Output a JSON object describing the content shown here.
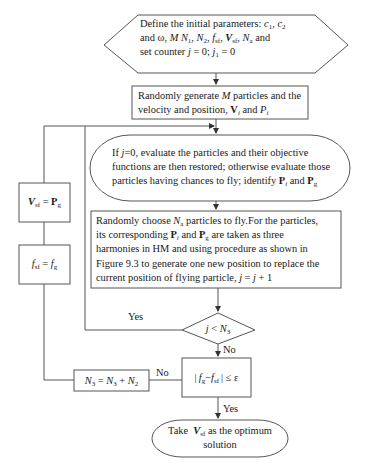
{
  "flowchart": {
    "start": {
      "shape": "hexagon",
      "lines": [
        "Define the initial parameters: c1, c2",
        "and ω, M N1, N2, fsf, Vsf, Na and",
        "set counter j = 0; j1 = 0"
      ]
    },
    "generate": {
      "shape": "rectangle",
      "lines": [
        "Randomly generate M particles and the",
        "velocity and position, Vi and Pi"
      ]
    },
    "evaluate": {
      "shape": "rounded",
      "lines": [
        "If j=0, evaluate the particles and their objective",
        "functions are then restored; otherwise evaluate those",
        "particles having chances to fly; identify Pi and Pg"
      ]
    },
    "fly": {
      "shape": "rectangle",
      "lines": [
        "Randomly choose Na particles to fly.For the particles,",
        "its corresponding Pi and Pg are taken as three",
        "harmonies in HM and using procedure as shown in",
        "Figure 9.3 to generate one new position to replace the",
        "current position of flying particle, j = j + 1"
      ]
    },
    "decision_loop": {
      "shape": "diamond",
      "text": "j < N3",
      "yes_label": "Yes",
      "no_label": "No"
    },
    "convergence_check": {
      "shape": "rectangle",
      "text": "|fg − fsf| ≤ ε",
      "yes_label": "Yes",
      "no_label": "No"
    },
    "update_n3": {
      "shape": "rectangle",
      "text": "N3 = N3 + N2"
    },
    "update_fsf": {
      "shape": "rectangle",
      "text": "fsf = fg"
    },
    "update_vsf": {
      "shape": "rectangle",
      "text": "Vsf = Pg"
    },
    "end": {
      "shape": "terminator",
      "lines": [
        "Take  Vsf as the optimum",
        "solution"
      ]
    }
  },
  "colors": {
    "stroke": "#555555",
    "text": "#1a1a1a",
    "background": "#ffffff"
  }
}
